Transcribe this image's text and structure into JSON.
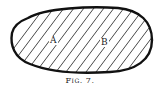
{
  "figure": {
    "caption": "Fig. 7.",
    "regions": [
      {
        "label": "A"
      },
      {
        "label": "B"
      }
    ],
    "shape": "closed oval region, hatched with diagonal lines",
    "colors": {
      "stroke": "#1a1a1a",
      "background": "#ffffff"
    }
  }
}
